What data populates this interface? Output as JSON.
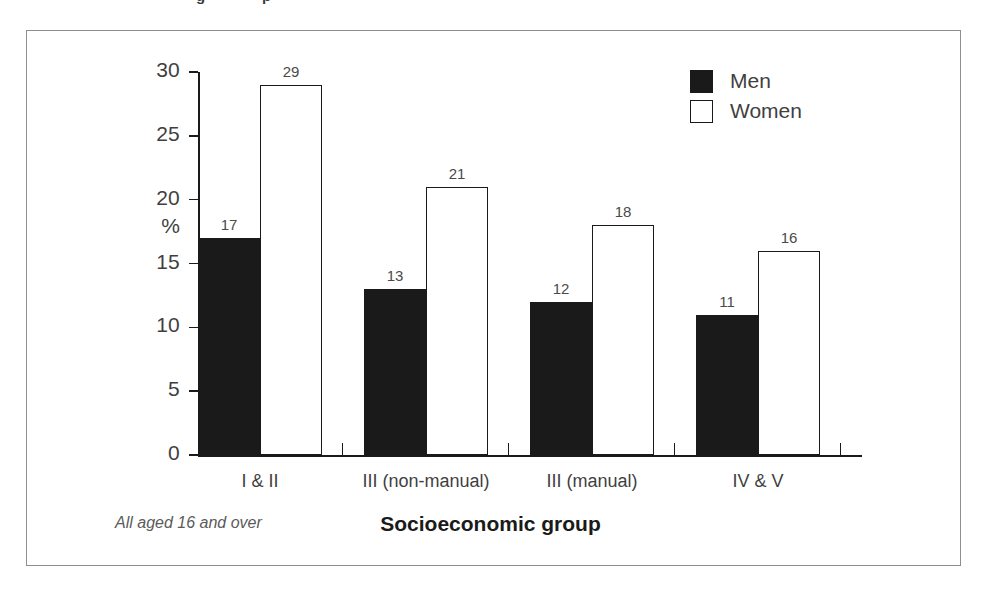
{
  "figure": {
    "footnote": "All aged 16 and over",
    "axis_title": "Socioeconomic group",
    "percent_symbol": "%",
    "border_color": "#8e8e8e",
    "ink_color": "#1a1a1a",
    "label_color": "#3f3f3f"
  },
  "top_fragments": [
    {
      "text": "g",
      "left": 196
    },
    {
      "text": "p",
      "left": 262
    }
  ],
  "legend": {
    "items": [
      {
        "label": "Men",
        "swatch": "filled",
        "color": "#1a1a1a"
      },
      {
        "label": "Women",
        "swatch": "hollow",
        "color": "#ffffff"
      }
    ]
  },
  "chart_data": {
    "type": "bar",
    "title": "",
    "subtitle": "",
    "xlabel": "Socioeconomic group",
    "ylabel": "%",
    "categories": [
      "I & II",
      "III (non-manual)",
      "III (manual)",
      "IV & V"
    ],
    "series": [
      {
        "name": "Men",
        "values": [
          17,
          13,
          12,
          11
        ]
      },
      {
        "name": "Women",
        "values": [
          29,
          21,
          18,
          16
        ]
      }
    ],
    "ylim": [
      0,
      30
    ],
    "yticks": [
      0,
      5,
      10,
      15,
      20,
      25,
      30
    ],
    "ytick_labels": [
      "0",
      "5",
      "10",
      "15",
      "20",
      "25",
      "30"
    ],
    "grid": false,
    "legend_position": "top-right",
    "data_labels": true,
    "annotation": "All aged 16 and over"
  }
}
